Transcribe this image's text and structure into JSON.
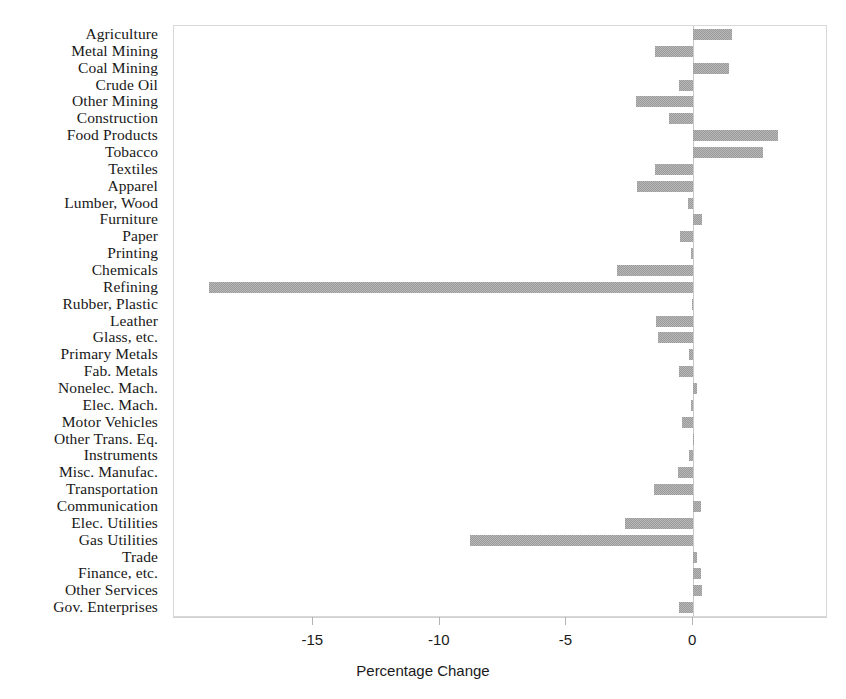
{
  "chart_data": {
    "type": "bar",
    "orientation": "horizontal",
    "title": "",
    "xlabel": "Percentage Change",
    "ylabel": "",
    "xlim": [
      -20.5,
      5.25
    ],
    "xticks": [
      -15,
      -10,
      -5,
      0
    ],
    "xtick_labels": [
      "-15",
      "-10",
      "-5",
      "0"
    ],
    "grid": false,
    "legend": "none",
    "bar_color": "#9a9a9a",
    "frame_color": "#d8d8d8",
    "categories": [
      "Agriculture",
      "Metal Mining",
      "Coal Mining",
      "Crude Oil",
      "Other Mining",
      "Construction",
      "Food Products",
      "Tobacco",
      "Textiles",
      "Apparel",
      "Lumber, Wood",
      "Furniture",
      "Paper",
      "Printing",
      "Chemicals",
      "Refining",
      "Rubber, Plastic",
      "Leather",
      "Glass, etc.",
      "Primary Metals",
      "Fab. Metals",
      "Nonelec. Mach.",
      "Elec. Mach.",
      "Motor Vehicles",
      "Other Trans. Eq.",
      "Instruments",
      "Misc. Manufac.",
      "Transportation",
      "Communication",
      "Elec. Utilities",
      "Gas Utilities",
      "Trade",
      "Finance, etc.",
      "Other Services",
      "Gov. Enterprises"
    ],
    "values": [
      1.55,
      -1.5,
      1.4,
      -0.55,
      -2.25,
      -0.95,
      3.35,
      2.75,
      -1.5,
      -2.2,
      -0.2,
      0.35,
      -0.5,
      -0.1,
      -3.0,
      -19.1,
      -0.05,
      -1.45,
      -1.4,
      -0.15,
      -0.55,
      0.15,
      -0.1,
      -0.45,
      0.05,
      -0.15,
      -0.6,
      -1.55,
      0.3,
      -2.7,
      -8.8,
      0.15,
      0.3,
      0.35,
      -0.55
    ]
  }
}
